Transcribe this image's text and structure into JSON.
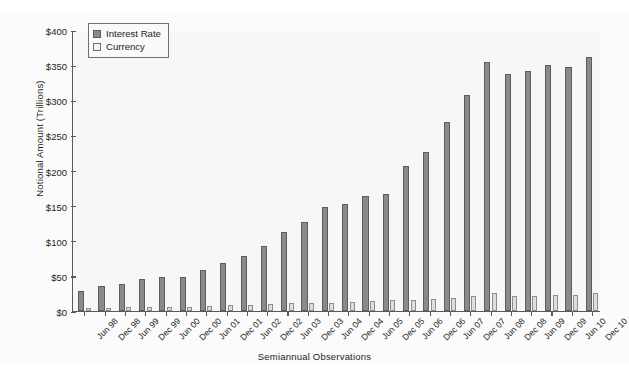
{
  "chart_data": {
    "type": "bar",
    "title": "",
    "xlabel": "Semiannual Observations",
    "ylabel": "Notional Amount (Trillions)",
    "ylim": [
      0,
      400
    ],
    "ytick_labels": [
      "$400",
      "$350",
      "$300",
      "$250",
      "$200",
      "$150",
      "$100",
      "$50",
      "$0"
    ],
    "ytick_values": [
      400,
      350,
      300,
      250,
      200,
      150,
      100,
      50,
      0
    ],
    "grid": false,
    "legend_position": "top-left",
    "categories": [
      "Jun 98",
      "Dec 98",
      "Jun 99",
      "Dec 99",
      "Jun 00",
      "Dec 00",
      "Jun 01",
      "Dec 01",
      "Jun 02",
      "Dec 02",
      "Jun 03",
      "Dec 03",
      "Jun 04",
      "Dec 04",
      "Jun 05",
      "Dec 05",
      "Jun 06",
      "Dec 06",
      "Jun 07",
      "Dec 07",
      "Jun 08",
      "Dec 08",
      "Jun 09",
      "Dec 09",
      "Jun 10",
      "Dec 10"
    ],
    "series": [
      {
        "name": "Interest Rate",
        "color": "#8a8a8a",
        "values": [
          29,
          36,
          39,
          45,
          48,
          49,
          58,
          68,
          78,
          92,
          112,
          127,
          148,
          152,
          164,
          167,
          207,
          227,
          269,
          307,
          354,
          337,
          342,
          350,
          348,
          362
        ]
      },
      {
        "name": "Currency",
        "color": "#dededc",
        "values": [
          5,
          5,
          6,
          6,
          6,
          6,
          7,
          8,
          9,
          10,
          11,
          12,
          12,
          13,
          14,
          15,
          16,
          17,
          19,
          21,
          25,
          22,
          22,
          23,
          23,
          25
        ]
      }
    ]
  },
  "legend": {
    "items": [
      {
        "label": "Interest Rate",
        "swatch": "interest-rate-swatch"
      },
      {
        "label": "Currency",
        "swatch": "currency-swatch"
      }
    ]
  }
}
